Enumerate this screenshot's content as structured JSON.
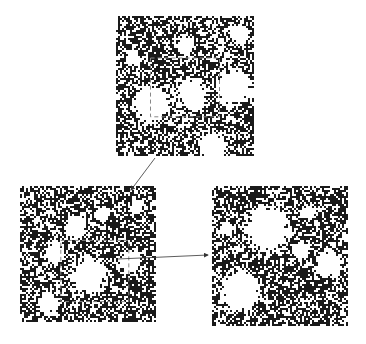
{
  "figure": {
    "colors": {
      "ink": "#1a1a1a",
      "paper": "#ffffff",
      "arrow": "#333333",
      "inset_box": "#888888"
    },
    "panels": [
      {
        "id": "top",
        "label": "",
        "x": 116,
        "y": 16,
        "w": 138,
        "h": 140,
        "seed": 11,
        "density": 0.58,
        "holes": [
          [
            0.25,
            0.62,
            0.12
          ],
          [
            0.55,
            0.55,
            0.1
          ],
          [
            0.85,
            0.5,
            0.12
          ],
          [
            0.7,
            0.93,
            0.1
          ],
          [
            0.5,
            0.2,
            0.06
          ],
          [
            0.88,
            0.12,
            0.06
          ],
          [
            0.12,
            0.3,
            0.05
          ]
        ],
        "inset": {
          "x": 0.25,
          "y": 0.3,
          "w": 0.5,
          "h": 0.42
        }
      },
      {
        "id": "bottom-left",
        "label": "",
        "x": 20,
        "y": 186,
        "w": 136,
        "h": 136,
        "seed": 23,
        "density": 0.6,
        "holes": [
          [
            0.5,
            0.65,
            0.12
          ],
          [
            0.4,
            0.3,
            0.08
          ],
          [
            0.25,
            0.48,
            0.07
          ],
          [
            0.8,
            0.55,
            0.08
          ],
          [
            0.6,
            0.2,
            0.05
          ],
          [
            0.85,
            0.15,
            0.05
          ],
          [
            0.2,
            0.85,
            0.07
          ]
        ],
        "inset": {
          "x": 0.3,
          "y": 0.4,
          "w": 0.5,
          "h": 0.45
        }
      },
      {
        "id": "bottom-right",
        "label": "",
        "x": 212,
        "y": 186,
        "w": 136,
        "h": 140,
        "seed": 37,
        "density": 0.62,
        "holes": [
          [
            0.4,
            0.3,
            0.16
          ],
          [
            0.2,
            0.75,
            0.14
          ],
          [
            0.65,
            0.45,
            0.06
          ],
          [
            0.85,
            0.55,
            0.09
          ],
          [
            0.1,
            0.3,
            0.05
          ],
          [
            0.7,
            0.18,
            0.05
          ]
        ],
        "inset": null
      }
    ],
    "arrows": [
      {
        "id": "arrow-top-to-left",
        "x1": 155,
        "y1": 158,
        "x2": 131,
        "y2": 190
      },
      {
        "id": "arrow-left-to-right",
        "x1": 118,
        "y1": 259,
        "x2": 208,
        "y2": 255
      }
    ]
  }
}
